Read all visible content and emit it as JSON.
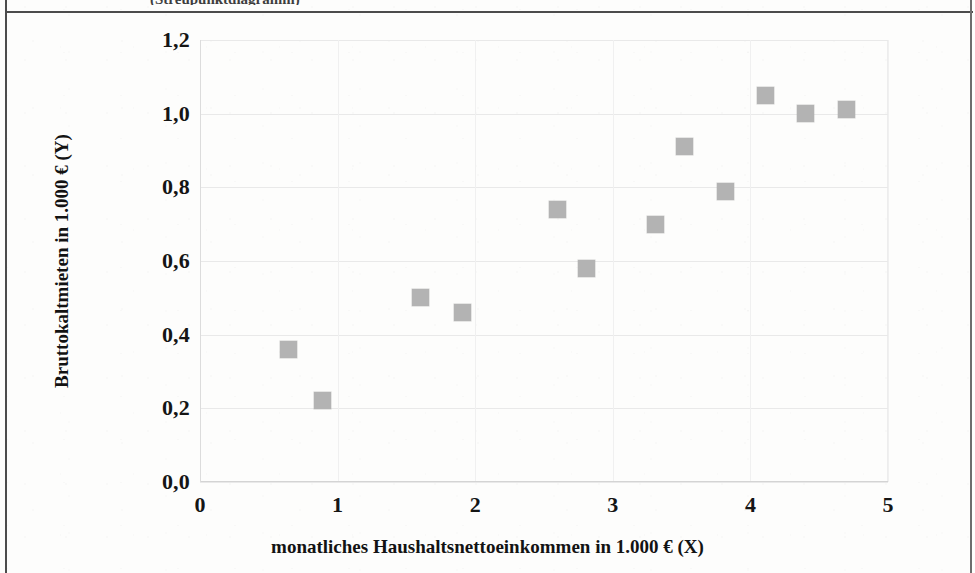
{
  "page": {
    "clipped_caption": "(Streupunktdiagramm)"
  },
  "chart_data": {
    "type": "scatter",
    "title": "",
    "xlabel": "monatliches Haushaltsnettoeinkommen in 1.000 € (X)",
    "ylabel": "Bruttokaltmieten in 1.000 € (Y)",
    "xlim": [
      0,
      5
    ],
    "ylim": [
      0.0,
      1.2
    ],
    "xticks": [
      "0",
      "1",
      "2",
      "3",
      "4",
      "5"
    ],
    "xtick_values": [
      0,
      1,
      2,
      3,
      4,
      5
    ],
    "yticks": [
      "0,0",
      "0,2",
      "0,4",
      "0,6",
      "0,8",
      "1,0",
      "1,2"
    ],
    "ytick_values": [
      0.0,
      0.2,
      0.4,
      0.6,
      0.8,
      1.0,
      1.2
    ],
    "grid": true,
    "legend": null,
    "marker_color": "#b3b3b3",
    "marker_shape": "square",
    "points": [
      {
        "x": 0.64,
        "y": 0.36
      },
      {
        "x": 0.89,
        "y": 0.22
      },
      {
        "x": 1.6,
        "y": 0.5
      },
      {
        "x": 1.91,
        "y": 0.46
      },
      {
        "x": 2.6,
        "y": 0.74
      },
      {
        "x": 2.81,
        "y": 0.58
      },
      {
        "x": 3.31,
        "y": 0.7
      },
      {
        "x": 3.52,
        "y": 0.91
      },
      {
        "x": 3.82,
        "y": 0.79
      },
      {
        "x": 4.11,
        "y": 1.05
      },
      {
        "x": 4.4,
        "y": 1.0
      },
      {
        "x": 4.7,
        "y": 1.01
      }
    ]
  }
}
